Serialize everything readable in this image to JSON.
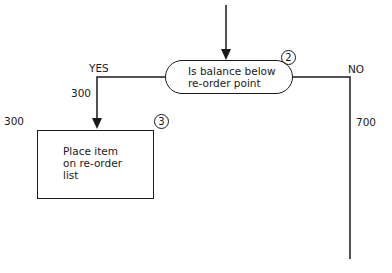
{
  "diagram": {
    "type": "flowchart",
    "decision": {
      "id_label": "2",
      "text_lines": [
        "Is balance below",
        "re-order point"
      ]
    },
    "process": {
      "id_label": "3",
      "text_lines": [
        "Place item",
        "on re-order",
        "list"
      ]
    },
    "branches": {
      "yes": {
        "label": "YES",
        "value": "300"
      },
      "no": {
        "label": "NO",
        "value": "700"
      }
    },
    "annotations": {
      "process_count": "300"
    }
  }
}
